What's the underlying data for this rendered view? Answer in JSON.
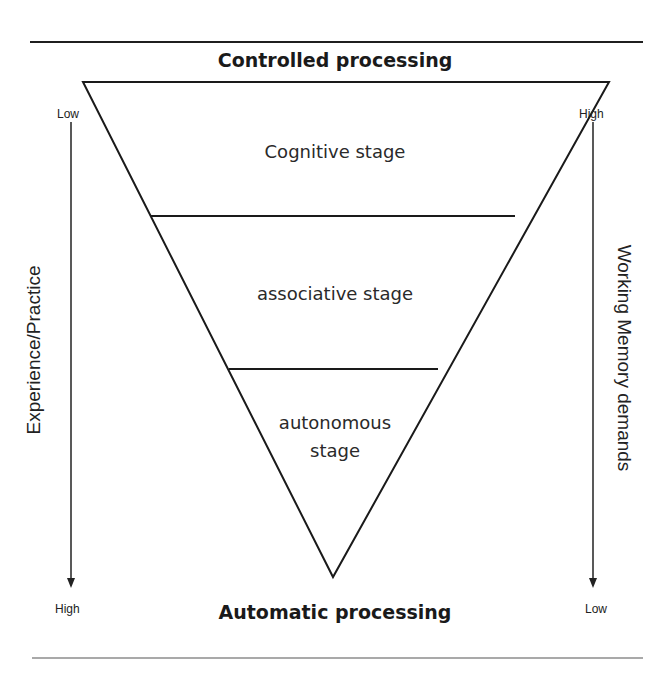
{
  "diagram": {
    "type": "inverted-triangle-stage-model",
    "top_label": "Controlled processing",
    "bottom_label": "Automatic processing",
    "stages": [
      {
        "label": "Cognitive stage"
      },
      {
        "label": "associative stage"
      },
      {
        "label_line1": "autonomous",
        "label_line2": "stage"
      }
    ],
    "left_axis": {
      "label": "Experience/Practice",
      "top": "Low",
      "bottom": "High",
      "direction": "down-arrow"
    },
    "right_axis": {
      "label": "Working Memory demands",
      "top": "High",
      "bottom": "Low",
      "direction": "down-arrow"
    },
    "colors": {
      "line": "#1a1a1a",
      "text": "#222222",
      "background": "#ffffff"
    }
  }
}
